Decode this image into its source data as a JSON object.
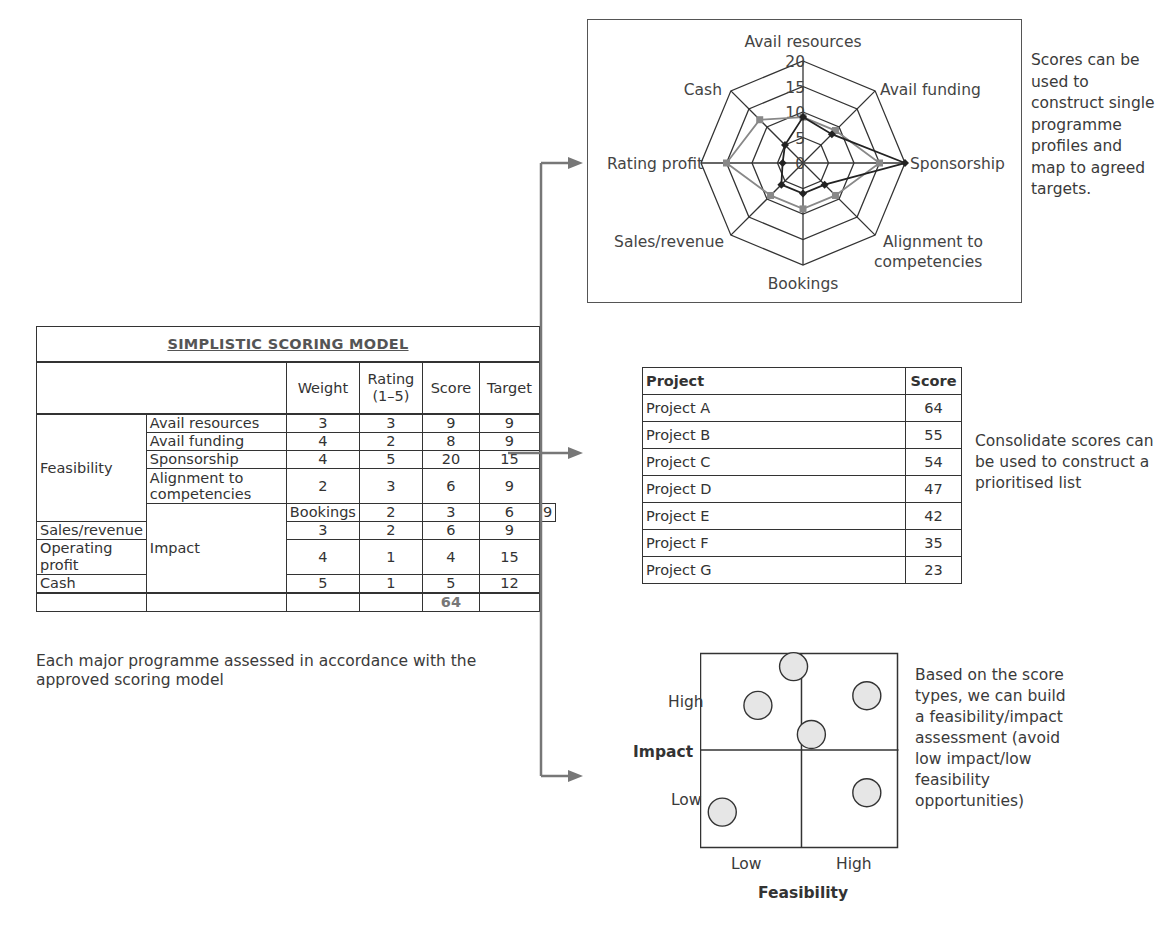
{
  "scoring_model": {
    "title": "SIMPLISTIC SCORING MODEL",
    "columns": [
      "Weight",
      "Rating (1–5)",
      "Score",
      "Target"
    ],
    "rating_label_line1": "Rating",
    "rating_label_line2": "(1–5)",
    "groups": [
      {
        "name": "Feasibility",
        "rows": [
          {
            "criterion": "Avail resources",
            "weight": "3",
            "rating": "3",
            "score": "9",
            "target": "9"
          },
          {
            "criterion": "Avail funding",
            "weight": "4",
            "rating": "2",
            "score": "8",
            "target": "9"
          },
          {
            "criterion": "Sponsorship",
            "weight": "4",
            "rating": "5",
            "score": "20",
            "target": "15"
          },
          {
            "criterion": "Alignment to competencies",
            "weight": "2",
            "rating": "3",
            "score": "6",
            "target": "9"
          }
        ]
      },
      {
        "name": "Impact",
        "rows": [
          {
            "criterion": "Bookings",
            "weight": "2",
            "rating": "3",
            "score": "6",
            "target": "9"
          },
          {
            "criterion": "Sales/revenue",
            "weight": "3",
            "rating": "2",
            "score": "6",
            "target": "9"
          },
          {
            "criterion": "Operating profit",
            "weight": "4",
            "rating": "1",
            "score": "4",
            "target": "15"
          },
          {
            "criterion": "Cash",
            "weight": "5",
            "rating": "1",
            "score": "5",
            "target": "12"
          }
        ]
      }
    ],
    "total_score": "64",
    "caption": "Each major programme assessed in accordance with the approved scoring model"
  },
  "radar_note": "Scores can be used to construct single programme profiles and map to agreed targets.",
  "list_note": "Consolidate scores can be used to construct a prioritised list",
  "matrix_note": "Based on the score types, we can build a feasibility/impact assessment (avoid low impact/low feasibility opportunities)",
  "project_list": {
    "headers": [
      "Project",
      "Score"
    ],
    "rows": [
      {
        "project": "Project A",
        "score": "64"
      },
      {
        "project": "Project B",
        "score": "55"
      },
      {
        "project": "Project C",
        "score": "54"
      },
      {
        "project": "Project D",
        "score": "47"
      },
      {
        "project": "Project E",
        "score": "42"
      },
      {
        "project": "Project F",
        "score": "35"
      },
      {
        "project": "Project G",
        "score": "23"
      }
    ]
  },
  "matrix": {
    "y_label": "Impact",
    "x_label": "Feasibility",
    "y_high": "High",
    "y_low": "Low",
    "x_low": "Low",
    "x_high": "High"
  },
  "colors": {
    "score_series": "#222222",
    "target_series": "#888888",
    "bubble_fill": "#e6e6e6"
  },
  "chart_data": [
    {
      "type": "radar",
      "title": "",
      "axes": [
        "Avail resources",
        "Avail funding",
        "Sponsorship",
        "Alignment to competencies",
        "Bookings",
        "Sales/revenue",
        "Rating profit",
        "Cash"
      ],
      "ticks": [
        "0",
        "5",
        "10",
        "15",
        "20"
      ],
      "range": [
        0,
        20
      ],
      "series": [
        {
          "name": "Score",
          "color": "#222222",
          "values": [
            9,
            8,
            20,
            6,
            6,
            6,
            4,
            5
          ]
        },
        {
          "name": "Target",
          "color": "#888888",
          "values": [
            9,
            9,
            15,
            9,
            9,
            9,
            15,
            12
          ]
        }
      ]
    },
    {
      "type": "scatter",
      "title": "Feasibility/impact matrix",
      "xlabel": "Feasibility",
      "ylabel": "Impact",
      "x_categories": [
        "Low",
        "High"
      ],
      "y_categories": [
        "Low",
        "High"
      ],
      "points": [
        {
          "x": 0.47,
          "y": 0.93
        },
        {
          "x": 0.29,
          "y": 0.73
        },
        {
          "x": 0.84,
          "y": 0.78
        },
        {
          "x": 0.56,
          "y": 0.58
        },
        {
          "x": 0.84,
          "y": 0.28
        },
        {
          "x": 0.11,
          "y": 0.18
        }
      ]
    }
  ]
}
